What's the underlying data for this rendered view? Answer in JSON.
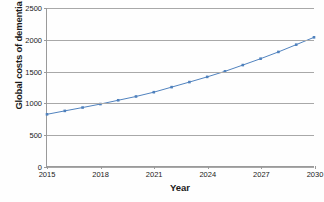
{
  "chart_data": {
    "type": "line",
    "title": "",
    "xlabel": "Year",
    "ylabel": "Global costs of dementia (bill. US$)",
    "xlim": [
      2015,
      2030
    ],
    "ylim": [
      0,
      2500
    ],
    "yticks": [
      0,
      500,
      1000,
      1500,
      2000,
      2500
    ],
    "ytick_labels": [
      "0",
      "500",
      "1000",
      "1500",
      "2000",
      "2500"
    ],
    "xticks": [
      2015,
      2018,
      2021,
      2024,
      2027,
      2030
    ],
    "xtick_labels": [
      "2015",
      "2018",
      "2021",
      "2024",
      "2027",
      "2030"
    ],
    "grid": "horizontal",
    "legend": "none",
    "series": [
      {
        "name": "Global costs of dementia",
        "color": "#4f81bd",
        "marker": "square",
        "x": [
          2015,
          2016,
          2017,
          2018,
          2019,
          2020,
          2021,
          2022,
          2023,
          2024,
          2025,
          2026,
          2027,
          2028,
          2029,
          2030
        ],
        "values": [
          818,
          872,
          925,
          980,
          1040,
          1100,
          1168,
          1248,
          1328,
          1410,
          1498,
          1597,
          1698,
          1805,
          1920,
          2036
        ]
      }
    ]
  }
}
